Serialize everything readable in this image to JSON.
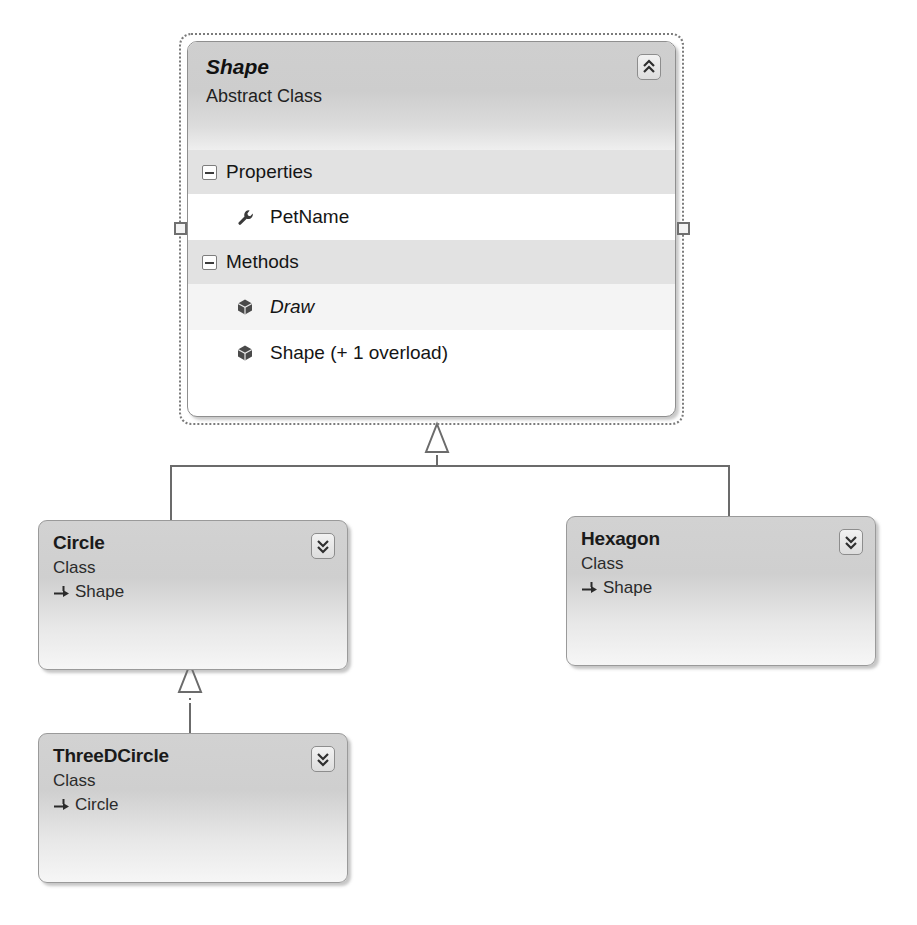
{
  "diagram": {
    "colors": {
      "box_border": "#9a9a9a",
      "box_fill_top": "#d2d2d2",
      "box_fill_bottom": "#f6f6f6",
      "header_fill": "#cfcfcf",
      "group_row_fill": "#e2e2e2",
      "member_row_fill": "#ffffff",
      "connector_line": "#6b6b6b",
      "selection_border": "#7b7b7b",
      "text": "#151515"
    }
  },
  "shape_class": {
    "name": "Shape",
    "kind": "Abstract Class",
    "collapse_icon": "chevron-double-up-icon",
    "selected": true,
    "groups": [
      {
        "label": "Properties",
        "toggle_icon": "minus-box-icon",
        "members": [
          {
            "name": "PetName",
            "icon": "wrench-icon",
            "italic": false
          }
        ]
      },
      {
        "label": "Methods",
        "toggle_icon": "minus-box-icon",
        "members": [
          {
            "name": "Draw",
            "icon": "cube-icon",
            "italic": true
          },
          {
            "name": "Shape (+ 1 overload)",
            "icon": "cube-icon",
            "italic": false
          }
        ]
      }
    ]
  },
  "circle_class": {
    "name": "Circle",
    "kind": "Class",
    "base": "Shape",
    "base_arrow_icon": "inherits-arrow-icon",
    "expand_icon": "chevron-double-down-icon"
  },
  "hexagon_class": {
    "name": "Hexagon",
    "kind": "Class",
    "base": "Shape",
    "base_arrow_icon": "inherits-arrow-icon",
    "expand_icon": "chevron-double-down-icon"
  },
  "threedcircle_class": {
    "name": "ThreeDCircle",
    "kind": "Class",
    "base": "Circle",
    "base_arrow_icon": "inherits-arrow-icon",
    "expand_icon": "chevron-double-down-icon"
  },
  "connections": [
    {
      "from": "Circle",
      "to": "Shape",
      "type": "generalization"
    },
    {
      "from": "Hexagon",
      "to": "Shape",
      "type": "generalization"
    },
    {
      "from": "ThreeDCircle",
      "to": "Circle",
      "type": "generalization"
    }
  ]
}
